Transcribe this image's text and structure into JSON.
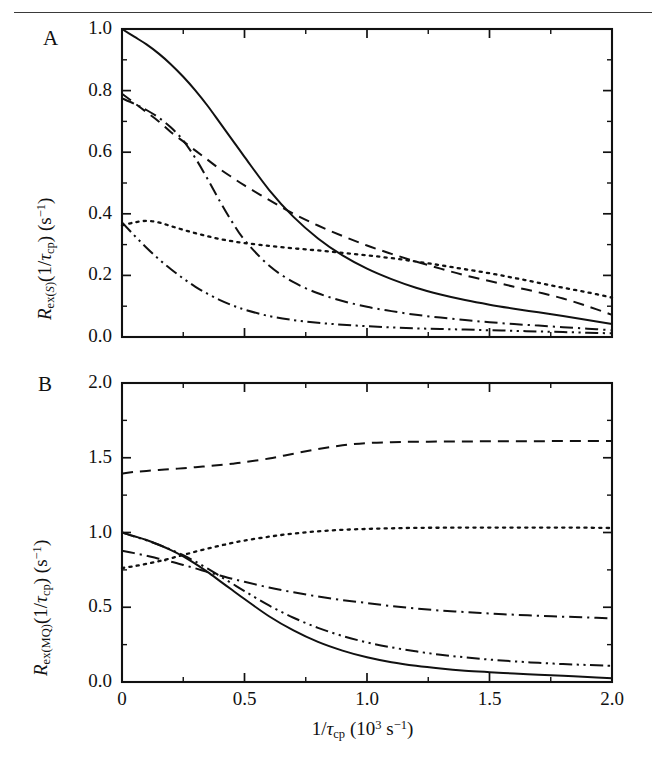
{
  "figure": {
    "panels": [
      {
        "letter": "A",
        "ylabel_html": "<span class=\"ital\">R</span><sub>ex(<span class=\"ital\">S</span>)</sub>(1/<span class=\"ital\">&tau;</span><sub>cp</sub>) (s<sup>&minus;1</sup>)",
        "ylabel_text": "Rex(S)(1/tau_cp) (s^-1)",
        "yticks": [
          "0.0",
          "0.2",
          "0.4",
          "0.6",
          "0.8",
          "1.0"
        ]
      },
      {
        "letter": "B",
        "ylabel_html": "<span class=\"ital\">R</span><sub>ex(MQ)</sub>(1/<span class=\"ital\">&tau;</span><sub>cp</sub>) (s<sup>&minus;1</sup>)",
        "ylabel_text": "Rex(MQ)(1/tau_cp) (s^-1)",
        "yticks": [
          "0.0",
          "0.5",
          "1.0",
          "1.5",
          "2.0"
        ]
      }
    ],
    "xlabel_html": "1/<span class=\"ital\">&tau;</span><sub>cp</sub> (10<sup>3</sup> s<sup>&minus;1</sup>)",
    "xlabel_text": "1/tau_cp (10^3 s^-1)",
    "xticks": [
      "0",
      "0.5",
      "1.0",
      "1.5",
      "2.0"
    ]
  },
  "chart_data": [
    {
      "type": "line",
      "panel": "A",
      "title": "",
      "xlabel": "1/tau_cp (10^3 s^-1)",
      "ylabel": "Rex(S)(1/tau_cp) (s^-1)",
      "xlim": [
        0,
        2.0
      ],
      "ylim": [
        0.0,
        1.0
      ],
      "xticks": [
        0,
        0.5,
        1.0,
        1.5,
        2.0
      ],
      "yticks": [
        0.0,
        0.2,
        0.4,
        0.6,
        0.8,
        1.0
      ],
      "xminor_step": 0.25,
      "yminor_step": 0.1,
      "grid": false,
      "legend": "none",
      "x": [
        0,
        0.05,
        0.1,
        0.15,
        0.2,
        0.25,
        0.3,
        0.35,
        0.4,
        0.45,
        0.5,
        0.6,
        0.7,
        0.8,
        0.9,
        1.0,
        1.1,
        1.2,
        1.3,
        1.4,
        1.5,
        1.6,
        1.7,
        1.8,
        1.9,
        2.0
      ],
      "series": [
        {
          "name": "solid",
          "style": "solid",
          "values": [
            1.0,
            0.975,
            0.95,
            0.92,
            0.885,
            0.845,
            0.8,
            0.75,
            0.695,
            0.64,
            0.585,
            0.478,
            0.39,
            0.32,
            0.265,
            0.222,
            0.188,
            0.16,
            0.138,
            0.12,
            0.105,
            0.092,
            0.08,
            0.068,
            0.055,
            0.042
          ]
        },
        {
          "name": "dashed",
          "style": "dashed",
          "values": [
            0.79,
            0.76,
            0.73,
            0.7,
            0.665,
            0.635,
            0.605,
            0.575,
            0.545,
            0.518,
            0.492,
            0.445,
            0.4,
            0.362,
            0.328,
            0.297,
            0.27,
            0.245,
            0.222,
            0.2,
            0.182,
            0.163,
            0.145,
            0.125,
            0.1,
            0.072
          ]
        },
        {
          "name": "dotted",
          "style": "dotted",
          "values": [
            0.362,
            0.372,
            0.377,
            0.372,
            0.36,
            0.348,
            0.337,
            0.327,
            0.318,
            0.311,
            0.305,
            0.296,
            0.288,
            0.281,
            0.273,
            0.265,
            0.256,
            0.245,
            0.233,
            0.22,
            0.207,
            0.192,
            0.176,
            0.16,
            0.145,
            0.128
          ]
        },
        {
          "name": "dash-dot",
          "style": "dashdot",
          "values": [
            0.775,
            0.757,
            0.737,
            0.712,
            0.68,
            0.638,
            0.58,
            0.512,
            0.44,
            0.373,
            0.315,
            0.232,
            0.178,
            0.142,
            0.117,
            0.098,
            0.084,
            0.072,
            0.063,
            0.055,
            0.048,
            0.042,
            0.037,
            0.032,
            0.027,
            0.022
          ]
        },
        {
          "name": "dash-dot-dot",
          "style": "dashdotdot",
          "values": [
            0.372,
            0.33,
            0.29,
            0.253,
            0.22,
            0.19,
            0.163,
            0.14,
            0.12,
            0.103,
            0.089,
            0.068,
            0.055,
            0.046,
            0.04,
            0.035,
            0.031,
            0.028,
            0.026,
            0.024,
            0.022,
            0.02,
            0.018,
            0.016,
            0.014,
            0.012
          ]
        }
      ]
    },
    {
      "type": "line",
      "panel": "B",
      "title": "",
      "xlabel": "1/tau_cp (10^3 s^-1)",
      "ylabel": "Rex(MQ)(1/tau_cp) (s^-1)",
      "xlim": [
        0,
        2.0
      ],
      "ylim": [
        0.0,
        2.0
      ],
      "xticks": [
        0,
        0.5,
        1.0,
        1.5,
        2.0
      ],
      "yticks": [
        0.0,
        0.5,
        1.0,
        1.5,
        2.0
      ],
      "xminor_step": 0.25,
      "yminor_step": 0.25,
      "grid": false,
      "legend": "none",
      "x": [
        0,
        0.05,
        0.1,
        0.15,
        0.2,
        0.25,
        0.3,
        0.35,
        0.4,
        0.45,
        0.5,
        0.6,
        0.7,
        0.8,
        0.9,
        1.0,
        1.1,
        1.2,
        1.3,
        1.4,
        1.5,
        1.6,
        1.7,
        1.8,
        1.9,
        2.0
      ],
      "series": [
        {
          "name": "solid",
          "style": "solid",
          "values": [
            1.0,
            0.975,
            0.95,
            0.918,
            0.882,
            0.84,
            0.79,
            0.735,
            0.675,
            0.615,
            0.555,
            0.44,
            0.345,
            0.268,
            0.21,
            0.165,
            0.132,
            0.108,
            0.09,
            0.076,
            0.066,
            0.057,
            0.049,
            0.042,
            0.034,
            0.025
          ]
        },
        {
          "name": "dashed",
          "style": "dashed",
          "values": [
            1.395,
            1.405,
            1.412,
            1.418,
            1.424,
            1.43,
            1.437,
            1.444,
            1.452,
            1.46,
            1.47,
            1.495,
            1.527,
            1.558,
            1.583,
            1.598,
            1.604,
            1.607,
            1.608,
            1.609,
            1.61,
            1.611,
            1.611,
            1.612,
            1.612,
            1.612
          ]
        },
        {
          "name": "dotted",
          "style": "dotted",
          "values": [
            0.762,
            0.775,
            0.79,
            0.808,
            0.828,
            0.85,
            0.872,
            0.893,
            0.912,
            0.93,
            0.946,
            0.972,
            0.993,
            1.008,
            1.018,
            1.024,
            1.028,
            1.031,
            1.032,
            1.033,
            1.033,
            1.033,
            1.033,
            1.033,
            1.032,
            1.03
          ]
        },
        {
          "name": "dash-dot",
          "style": "dashdot",
          "values": [
            0.878,
            0.862,
            0.845,
            0.825,
            0.805,
            0.783,
            0.76,
            0.735,
            0.712,
            0.69,
            0.67,
            0.632,
            0.6,
            0.572,
            0.548,
            0.528,
            0.508,
            0.492,
            0.478,
            0.468,
            0.458,
            0.45,
            0.443,
            0.437,
            0.432,
            0.425
          ]
        },
        {
          "name": "dash-dot-dot",
          "style": "dashdotdot",
          "values": [
            1.0,
            0.973,
            0.948,
            0.918,
            0.885,
            0.848,
            0.805,
            0.758,
            0.708,
            0.658,
            0.608,
            0.512,
            0.43,
            0.362,
            0.308,
            0.265,
            0.232,
            0.205,
            0.182,
            0.165,
            0.15,
            0.138,
            0.128,
            0.12,
            0.114,
            0.108
          ]
        }
      ]
    }
  ]
}
